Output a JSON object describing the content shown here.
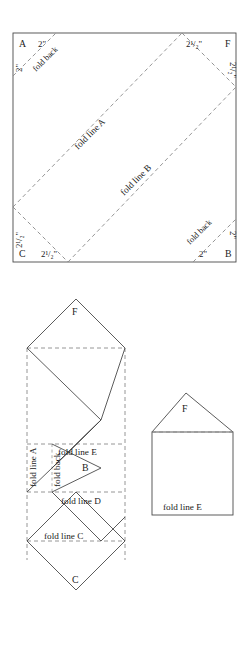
{
  "figure": {
    "title": "",
    "type": "folding-diagram",
    "background": "#ffffff",
    "solid_line_color": "#4a4a4a",
    "dashed_line_color": "#8a8a8a"
  },
  "diagram_top": {
    "name": "square-pattern-sheet",
    "corners": {
      "top_left": "A",
      "top_right": "F",
      "bottom_left": "C",
      "bottom_right": "B"
    },
    "dimensions": {
      "top_left_horizontal": "2\"",
      "top_left_vertical": "2\"",
      "top_right_horizontal": "2¹/₂\"",
      "top_right_vertical": "2¹/₂\"",
      "bottom_left_horizontal": "2¹/₂\"",
      "bottom_left_vertical": "2¹/₂\"",
      "bottom_right_horizontal": "2\"",
      "bottom_right_vertical": "2\""
    },
    "fold_labels": {
      "top_left_fold_back": "fold back",
      "bottom_right_fold_back": "fold back",
      "fold_line_a": "fold line A",
      "fold_line_b": "fold line B"
    }
  },
  "diagram_middle": {
    "name": "folded-strip-pattern",
    "labels": {
      "top_flap": "F",
      "bottom_flap": "C",
      "inner_flap": "B",
      "fold_line_a": "fold line A",
      "fold_back": "fold back",
      "fold_line_e": "fold line E",
      "fold_line_d": "fold line D",
      "fold_line_c": "fold line C"
    }
  },
  "diagram_right": {
    "name": "finished-envelope",
    "labels": {
      "flap": "F",
      "fold_line_e": "fold line E"
    }
  }
}
